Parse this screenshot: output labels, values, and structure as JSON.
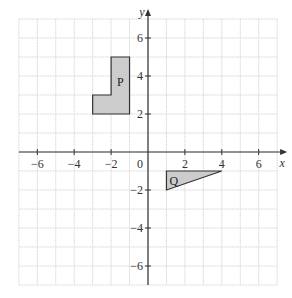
{
  "chart_data": {
    "type": "diagram",
    "title": "",
    "xlabel": "x",
    "ylabel": "y",
    "xlim": [
      -7,
      7
    ],
    "ylim": [
      -7,
      7
    ],
    "grid": true,
    "origin_label": "0",
    "x_ticks": [
      -6,
      -4,
      -2,
      2,
      4,
      6
    ],
    "y_ticks": [
      6,
      4,
      2,
      -2,
      -4,
      -6
    ],
    "x_tick_labels": [
      "−6",
      "−4",
      "−2",
      "2",
      "4",
      "6"
    ],
    "y_tick_labels": [
      "6",
      "4",
      "2",
      "−2",
      "−4",
      "−6"
    ],
    "shapes": [
      {
        "name": "P",
        "label": "P",
        "type": "polygon",
        "vertices": [
          [
            -3,
            2
          ],
          [
            -1,
            2
          ],
          [
            -1,
            5
          ],
          [
            -2,
            5
          ],
          [
            -2,
            3
          ],
          [
            -3,
            3
          ]
        ],
        "label_position": [
          -1.5,
          3.7
        ],
        "fill": "#cccccc"
      },
      {
        "name": "Q",
        "label": "Q",
        "type": "triangle",
        "vertices": [
          [
            1,
            -1
          ],
          [
            4,
            -1
          ],
          [
            1,
            -2
          ]
        ],
        "label_position": [
          1.4,
          -1.5
        ],
        "fill": "#cccccc"
      }
    ]
  },
  "axes": {
    "x_name": "x",
    "y_name": "y",
    "origin": "0"
  },
  "colors": {
    "grid": "#dddddd",
    "axis": "#333333",
    "shape_fill": "#cccccc",
    "shape_stroke": "#333333"
  }
}
